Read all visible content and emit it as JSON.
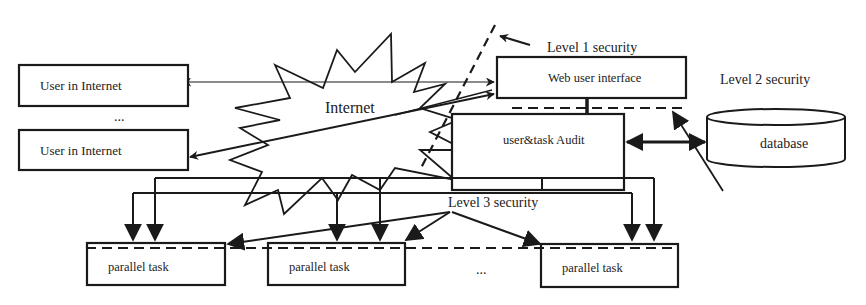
{
  "diagram": {
    "type": "system-security-architecture",
    "cloud": {
      "label": "Internet"
    },
    "nodes": {
      "user_top": {
        "label": "User in Internet"
      },
      "user_bottom": {
        "label": "User in Internet"
      },
      "users_ellipsis": {
        "label": "..."
      },
      "web_ui": {
        "label": "Web user interface"
      },
      "audit": {
        "label": "user&task Audit"
      },
      "database": {
        "label": "database"
      },
      "task1": {
        "label": "parallel task"
      },
      "task2": {
        "label": "parallel task"
      },
      "task3": {
        "label": "parallel task"
      },
      "tasks_ellipsis": {
        "label": "..."
      }
    },
    "annotations": {
      "level1": "Level 1 security",
      "level2": "Level 2 security",
      "level3": "Level 3 security"
    },
    "edges": [
      {
        "from": "web_ui",
        "to": "user_top",
        "style": "arrow-both"
      },
      {
        "from": "user_bottom",
        "to": "web_ui",
        "style": "arrow-both"
      },
      {
        "from": "web_ui",
        "to": "audit",
        "style": "line"
      },
      {
        "from": "audit",
        "to": "database",
        "style": "arrow-both-bold"
      },
      {
        "from": "audit",
        "to": "task1",
        "style": "arrow"
      },
      {
        "from": "audit",
        "to": "task2",
        "style": "arrow"
      },
      {
        "from": "audit",
        "to": "task3",
        "style": "arrow"
      }
    ],
    "colors": {
      "stroke": "#1a1a1a",
      "background": "#ffffff"
    }
  }
}
